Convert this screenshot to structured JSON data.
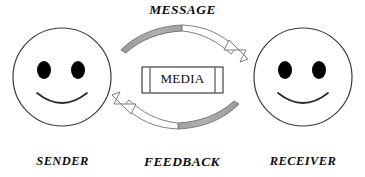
{
  "diagram": {
    "background_color": "#ffffff",
    "labels": {
      "message": "MESSAGE",
      "feedback": "FEEDBACK",
      "sender": "SENDER",
      "receiver": "RECEIVER",
      "media": "MEDIA"
    },
    "colors": {
      "outline": "#3a3a3a",
      "arrow_fill_gray": "#a8a8a8",
      "arrow_fill_white": "#ffffff",
      "eye_fill": "#000000",
      "text": "#0d0d0d",
      "shadow": "#bdbdbd",
      "box_border": "#2e2e2e"
    },
    "nodes": [
      {
        "name": "sender-face",
        "label": "SENDER",
        "role": "sender",
        "shape": "smiley-circle"
      },
      {
        "name": "receiver-face",
        "label": "RECEIVER",
        "role": "receiver",
        "shape": "smiley-circle"
      },
      {
        "name": "media-box",
        "label": "MEDIA",
        "role": "channel",
        "shape": "rectangle-with-end-caps"
      }
    ],
    "flows": [
      {
        "name": "message-arrow",
        "label": "MESSAGE",
        "from": "sender-face",
        "to": "receiver-face",
        "direction": "left-to-right",
        "position": "top"
      },
      {
        "name": "feedback-arrow",
        "label": "FEEDBACK",
        "from": "receiver-face",
        "to": "sender-face",
        "direction": "right-to-left",
        "position": "bottom"
      }
    ]
  }
}
